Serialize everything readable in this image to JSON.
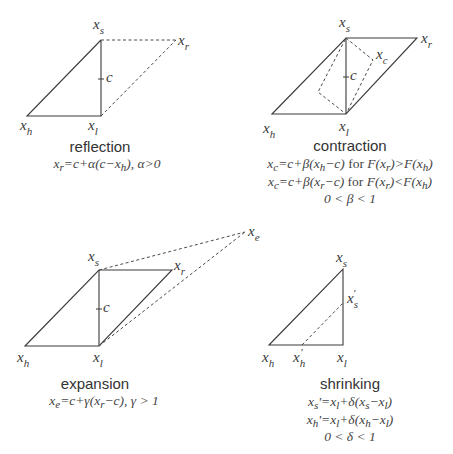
{
  "panels": {
    "reflection": {
      "title": "reflection",
      "equations": [
        "x_r = c + α(c − x_h), α > 0"
      ],
      "eq1": {
        "x": "x",
        "xs": "r",
        "a": "=c+α(c−",
        "x2": "x",
        "x2s": "h",
        "b": "), α>0"
      },
      "labels": {
        "xs": "s",
        "xr": "r",
        "xh": "h",
        "xl": "l",
        "c": "c"
      }
    },
    "contraction": {
      "title": "contraction",
      "equations": [
        "x_c = c + β(x_h − c) for F(x_r) > F(x_h)",
        "x_c = c + β(x_r − c) for F(x_r) < F(x_h)",
        "0 < β < 1"
      ],
      "eq1": {
        "x": "x",
        "xs": "c",
        "a": "=c+β(",
        "x2": "x",
        "x2s": "h",
        "b": "−c) ",
        "for": "for",
        "F": " F(",
        "x3": "x",
        "x3s": "r",
        "c": ")>F(",
        "x4": "x",
        "x4s": "h",
        "d": ")"
      },
      "eq2": {
        "x": "x",
        "xs": "c",
        "a": "=c+β(",
        "x2": "x",
        "x2s": "r",
        "b": "−c) ",
        "for": "for",
        "F": " F(",
        "x3": "x",
        "x3s": "r",
        "c": ")<F(",
        "x4": "x",
        "x4s": "h",
        "d": ")"
      },
      "eq3": "0 < β < 1",
      "labels": {
        "xs": "s",
        "xr": "r",
        "xh": "h",
        "xl": "l",
        "xc": "c",
        "c": "c"
      }
    },
    "expansion": {
      "title": "expansion",
      "equations": [
        "x_e = c + γ(x_r − c), γ > 1"
      ],
      "eq1": {
        "x": "x",
        "xs": "e",
        "a": "=c+γ(",
        "x2": "x",
        "x2s": "r",
        "b": "−c), γ > 1"
      },
      "labels": {
        "xs": "s",
        "xr": "r",
        "xh": "h",
        "xl": "l",
        "xe": "e",
        "c": "c"
      }
    },
    "shrinking": {
      "title": "shrinking",
      "equations": [
        "x_s' = x_l + δ(x_s − x_l)",
        "x_h' = x_l + δ(x_h − x_l)",
        "0 < δ < 1"
      ],
      "eq1": {
        "x": "x",
        "xs": "s",
        "p": "'",
        "a": "=",
        "x2": "x",
        "x2s": "l",
        "b": "+δ(",
        "x3": "x",
        "x3s": "s",
        "c": "−",
        "x4": "x",
        "x4s": "l",
        "d": ")"
      },
      "eq2": {
        "x": "x",
        "xs": "h",
        "p": "'",
        "a": "=",
        "x2": "x",
        "x2s": "l",
        "b": "+δ(",
        "x3": "x",
        "x3s": "h",
        "c": "−",
        "x4": "x",
        "x4s": "l",
        "d": ")"
      },
      "eq3": "0 < δ < 1",
      "labels": {
        "xs": "s",
        "xsp": "s",
        "xh": "h",
        "xhp": "h",
        "xl": "l",
        "prime": "'"
      }
    }
  },
  "x": "x"
}
